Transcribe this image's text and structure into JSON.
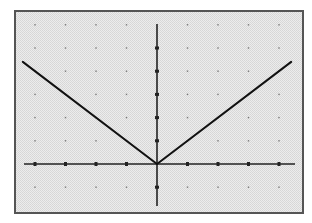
{
  "chart_data": {
    "type": "line",
    "title": "",
    "xlabel": "",
    "ylabel": "",
    "function": "y = |x|",
    "xlim": [
      -4.4,
      4.4
    ],
    "ylim": [
      -1.8,
      6.1
    ],
    "grid": "dots",
    "x_ticks": [
      -4,
      -3,
      -2,
      -1,
      1,
      2,
      3,
      4
    ],
    "y_ticks": [
      -1,
      1,
      2,
      3,
      4,
      5
    ],
    "series": [
      {
        "name": "y=|x|",
        "x": [
          -4.4,
          0,
          4.4
        ],
        "y": [
          4.4,
          0,
          4.4
        ]
      }
    ],
    "legend": null
  },
  "style": {
    "background": "#ffffff",
    "plot_fill": "#e6e6e6",
    "frame_color": "#555555",
    "axis_color": "#222222",
    "line_color": "#111111",
    "dot_color": "#777777"
  },
  "layout": {
    "frame": {
      "x": 15,
      "y": 11,
      "w": 288,
      "h": 202
    },
    "origin_px": [
      157,
      164
    ],
    "unit_px_x": 30.5,
    "unit_px_y": 23.2,
    "xaxis_px": [
      24,
      295
    ],
    "yaxis_px": [
      24,
      206
    ]
  }
}
